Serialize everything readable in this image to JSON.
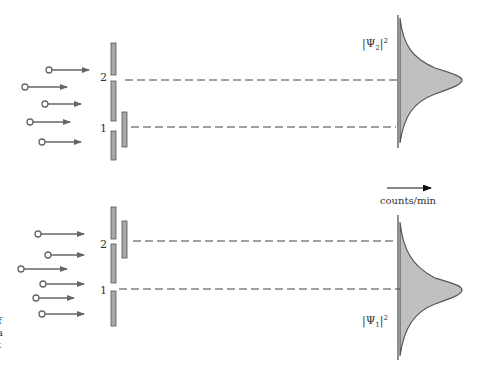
{
  "figure": {
    "top_panel": {
      "slit_labels": [
        "2",
        "1"
      ],
      "closed_slit": "1",
      "open_slit": "2",
      "distribution_label": "|Ψ",
      "distribution_subscript": "2",
      "distribution_superscript": "2",
      "particle_count": 5
    },
    "bottom_panel": {
      "slit_labels": [
        "2",
        "1"
      ],
      "closed_slit": "2",
      "open_slit": "1",
      "distribution_label": "|Ψ",
      "distribution_subscript": "1",
      "distribution_superscript": "2",
      "particle_count": 6
    },
    "axis_label": "counts/min",
    "left_edge_fragments": [
      "f",
      "a",
      "t"
    ]
  },
  "colors": {
    "bar_fill": "#a8a8a8",
    "bar_stroke": "#555555",
    "curve_fill": "#c0c0c0",
    "curve_stroke": "#555555",
    "arrow": "#666666",
    "dash": "#444444"
  }
}
